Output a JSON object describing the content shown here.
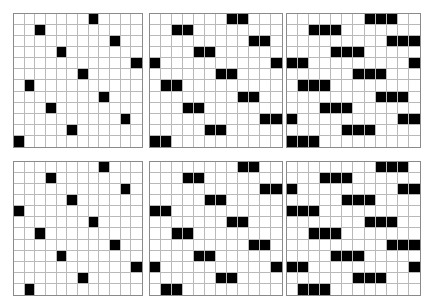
{
  "panels": [
    {
      "id": "top-1",
      "position": {
        "left": 13,
        "top": 13,
        "width": 130,
        "height": 135
      },
      "rows": 12,
      "cols": 12,
      "run_length": 1,
      "filled": [
        [
          7
        ],
        [
          2
        ],
        [
          9
        ],
        [
          4
        ],
        [
          11
        ],
        [
          6
        ],
        [
          1
        ],
        [
          8
        ],
        [
          3
        ],
        [
          10
        ],
        [
          5
        ],
        [
          0
        ]
      ]
    },
    {
      "id": "top-2",
      "position": {
        "left": 149,
        "top": 13,
        "width": 134,
        "height": 135
      },
      "rows": 12,
      "cols": 12,
      "run_length": 2,
      "filled": [
        [
          7,
          8
        ],
        [
          2,
          3
        ],
        [
          9,
          10
        ],
        [
          4,
          5
        ],
        [
          11,
          0
        ],
        [
          6,
          7
        ],
        [
          1,
          2
        ],
        [
          8,
          9
        ],
        [
          3,
          4
        ],
        [
          10,
          11
        ],
        [
          5,
          6
        ],
        [
          0,
          1
        ]
      ]
    },
    {
      "id": "top-3",
      "position": {
        "left": 286,
        "top": 13,
        "width": 135,
        "height": 135
      },
      "rows": 12,
      "cols": 12,
      "run_length": 3,
      "filled": [
        [
          7,
          8,
          9
        ],
        [
          2,
          3,
          4
        ],
        [
          9,
          10,
          11
        ],
        [
          4,
          5,
          6
        ],
        [
          11,
          0,
          1
        ],
        [
          6,
          7,
          8
        ],
        [
          1,
          2,
          3
        ],
        [
          8,
          9,
          10
        ],
        [
          3,
          4,
          5
        ],
        [
          10,
          11,
          0
        ],
        [
          5,
          6,
          7
        ],
        [
          0,
          1,
          2
        ]
      ]
    },
    {
      "id": "bottom-1",
      "position": {
        "left": 13,
        "top": 161,
        "width": 130,
        "height": 135
      },
      "rows": 12,
      "cols": 12,
      "run_length": 1,
      "filled": [
        [
          8
        ],
        [
          3
        ],
        [
          10
        ],
        [
          5
        ],
        [
          0
        ],
        [
          7
        ],
        [
          2
        ],
        [
          9
        ],
        [
          4
        ],
        [
          11
        ],
        [
          6
        ],
        [
          1
        ]
      ]
    },
    {
      "id": "bottom-2",
      "position": {
        "left": 149,
        "top": 161,
        "width": 134,
        "height": 135
      },
      "rows": 12,
      "cols": 12,
      "run_length": 2,
      "filled": [
        [
          8,
          9
        ],
        [
          3,
          4
        ],
        [
          10,
          11
        ],
        [
          5,
          6
        ],
        [
          0,
          1
        ],
        [
          7,
          8
        ],
        [
          2,
          3
        ],
        [
          9,
          10
        ],
        [
          4,
          5
        ],
        [
          11,
          0
        ],
        [
          6,
          7
        ],
        [
          1,
          2
        ]
      ]
    },
    {
      "id": "bottom-3",
      "position": {
        "left": 286,
        "top": 161,
        "width": 135,
        "height": 135
      },
      "rows": 12,
      "cols": 12,
      "run_length": 3,
      "filled": [
        [
          8,
          9,
          10
        ],
        [
          3,
          4,
          5
        ],
        [
          10,
          11,
          0
        ],
        [
          5,
          6,
          7
        ],
        [
          0,
          1,
          2
        ],
        [
          7,
          8,
          9
        ],
        [
          2,
          3,
          4
        ],
        [
          9,
          10,
          11
        ],
        [
          4,
          5,
          6
        ],
        [
          11,
          0,
          1
        ],
        [
          6,
          7,
          8
        ],
        [
          1,
          2,
          3
        ]
      ]
    }
  ],
  "colors": {
    "filled": "#000000",
    "empty": "#ffffff",
    "grid_line": "#b9b9b9",
    "border": "#8a8a8a"
  }
}
